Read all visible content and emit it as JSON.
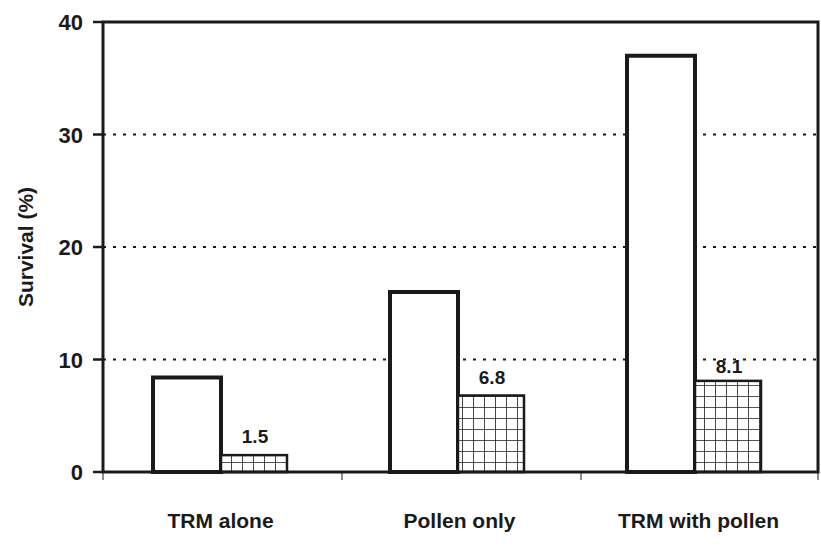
{
  "chart_data": {
    "type": "bar",
    "title": "",
    "xlabel": "",
    "ylabel": "Survival (%)",
    "ylim": [
      0,
      40
    ],
    "yticks": [
      0,
      10,
      20,
      30,
      40
    ],
    "grid": {
      "y": true,
      "style": "dotted",
      "at": [
        10,
        20,
        30
      ]
    },
    "legend": null,
    "categories": [
      "TRM alone",
      "Pollen only",
      "TRM with pollen"
    ],
    "series": [
      {
        "name": "open bars",
        "fill": "white",
        "values": [
          8.4,
          16.0,
          37.0
        ]
      },
      {
        "name": "cross-hatched bars",
        "fill": "grid-hatch",
        "values": [
          1.5,
          6.8,
          8.1
        ]
      }
    ],
    "annotations": [
      {
        "category": "TRM alone",
        "series": 1,
        "text": "1.5"
      },
      {
        "category": "Pollen only",
        "series": 1,
        "text": "6.8"
      },
      {
        "category": "TRM with pollen",
        "series": 1,
        "text": "8.1"
      }
    ]
  },
  "colors": {
    "ink": "#1a1a1a",
    "background": "#ffffff"
  }
}
